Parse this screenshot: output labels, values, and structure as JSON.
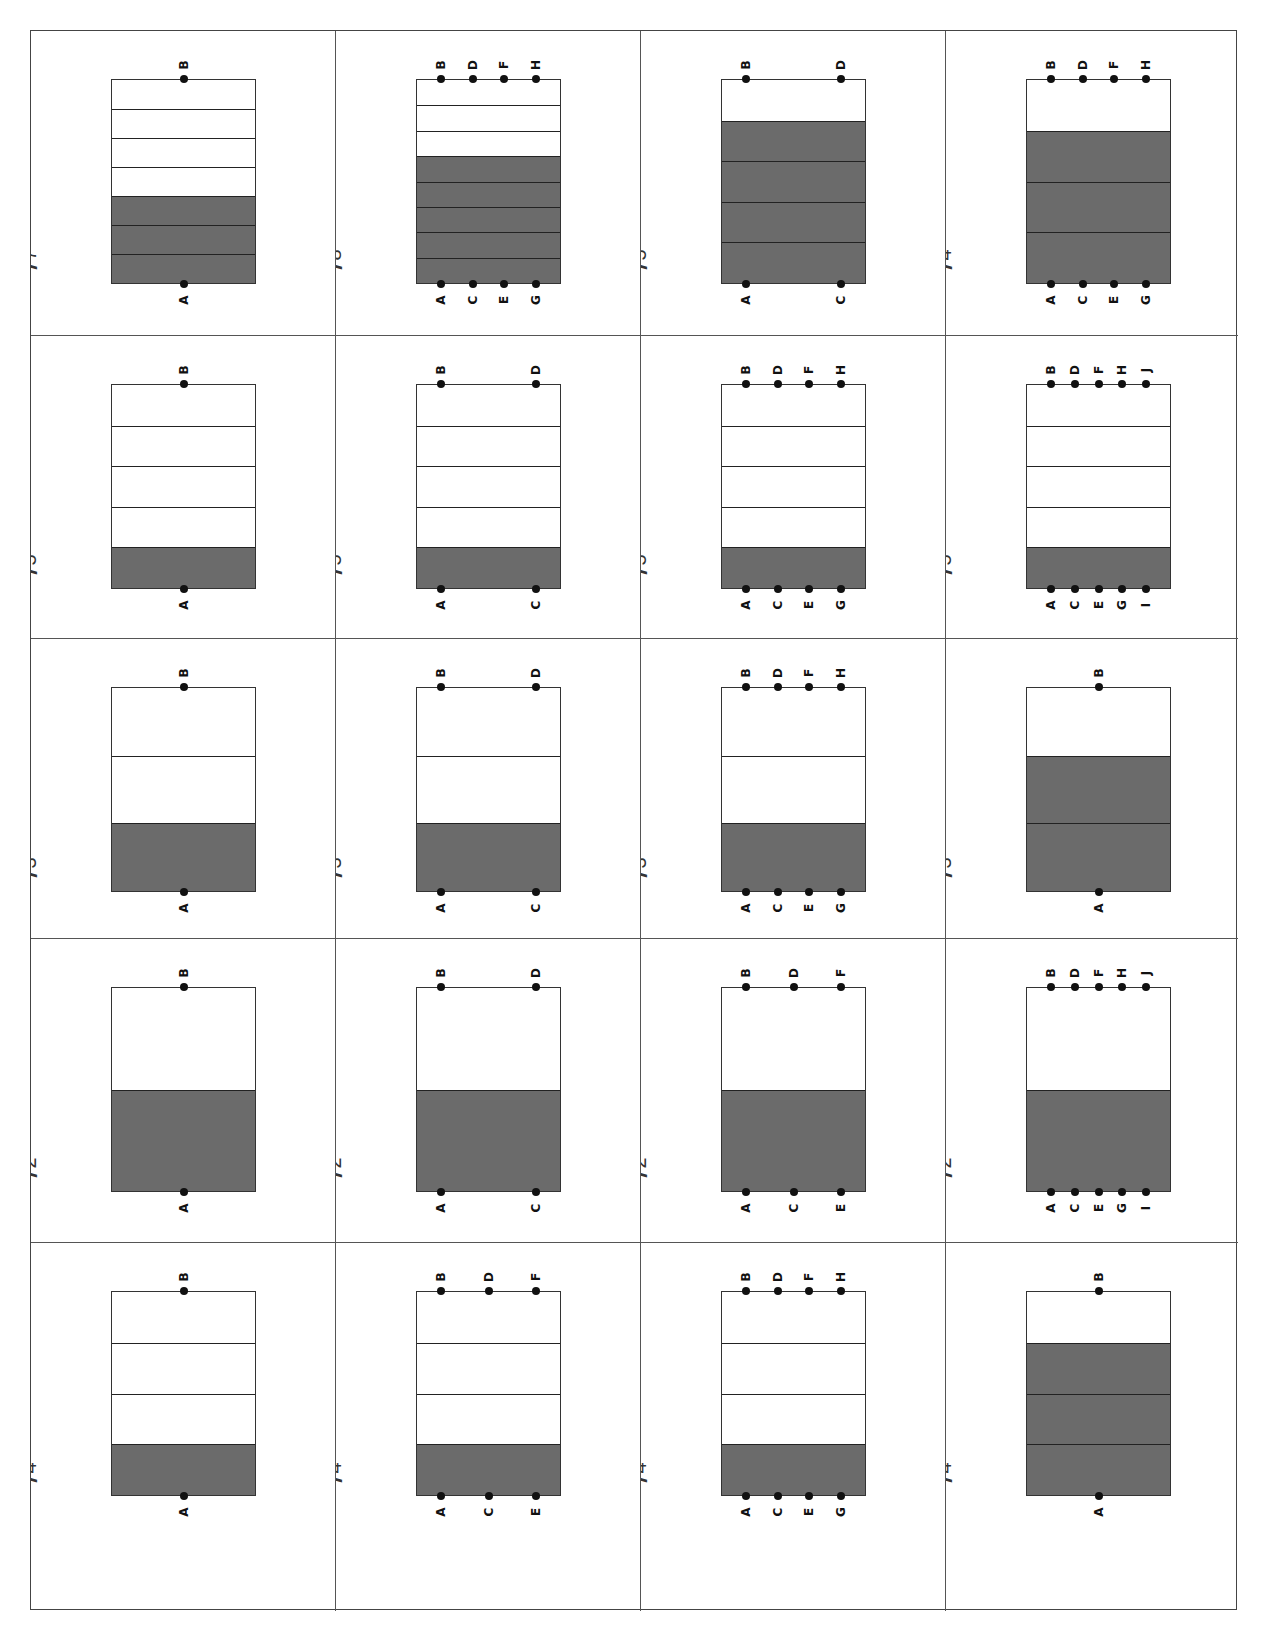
{
  "worksheet": {
    "phrase": "is also",
    "shade_color": "#6b6b6b",
    "rows": [
      [
        {
          "num": "3",
          "den": "7",
          "parts": 7,
          "shaded": 3,
          "bottom": [
            "A"
          ],
          "top": [
            "B"
          ]
        },
        {
          "num": "5",
          "den": "8",
          "parts": 8,
          "shaded": 5,
          "bottom": [
            "A",
            "C",
            "E",
            "G"
          ],
          "top": [
            "B",
            "D",
            "F",
            "H"
          ]
        },
        {
          "num": "4",
          "den": "5",
          "parts": 5,
          "shaded": 4,
          "bottom": [
            "A",
            "C"
          ],
          "top": [
            "B",
            "D"
          ]
        },
        {
          "num": "3",
          "den": "4",
          "parts": 4,
          "shaded": 3,
          "bottom": [
            "A",
            "C",
            "E",
            "G"
          ],
          "top": [
            "B",
            "D",
            "F",
            "H"
          ]
        }
      ],
      [
        {
          "num": "1",
          "den": "5",
          "parts": 5,
          "shaded": 1,
          "bottom": [
            "A"
          ],
          "top": [
            "B"
          ]
        },
        {
          "num": "1",
          "den": "5",
          "parts": 5,
          "shaded": 1,
          "bottom": [
            "A",
            "C"
          ],
          "top": [
            "B",
            "D"
          ]
        },
        {
          "num": "1",
          "den": "5",
          "parts": 5,
          "shaded": 1,
          "bottom": [
            "A",
            "C",
            "E",
            "G"
          ],
          "top": [
            "B",
            "D",
            "F",
            "H"
          ]
        },
        {
          "num": "1",
          "den": "5",
          "parts": 5,
          "shaded": 1,
          "bottom": [
            "A",
            "C",
            "E",
            "G",
            "I"
          ],
          "top": [
            "B",
            "D",
            "F",
            "H",
            "J"
          ]
        }
      ],
      [
        {
          "num": "1",
          "den": "3",
          "parts": 3,
          "shaded": 1,
          "bottom": [
            "A"
          ],
          "top": [
            "B"
          ]
        },
        {
          "num": "1",
          "den": "3",
          "parts": 3,
          "shaded": 1,
          "bottom": [
            "A",
            "C"
          ],
          "top": [
            "B",
            "D"
          ]
        },
        {
          "num": "1",
          "den": "3",
          "parts": 3,
          "shaded": 1,
          "bottom": [
            "A",
            "C",
            "E",
            "G"
          ],
          "top": [
            "B",
            "D",
            "F",
            "H"
          ]
        },
        {
          "num": "2",
          "den": "3",
          "parts": 3,
          "shaded": 2,
          "bottom": [
            "A"
          ],
          "top": [
            "B"
          ]
        }
      ],
      [
        {
          "num": "1",
          "den": "2",
          "parts": 2,
          "shaded": 1,
          "bottom": [
            "A"
          ],
          "top": [
            "B"
          ]
        },
        {
          "num": "1",
          "den": "2",
          "parts": 2,
          "shaded": 1,
          "bottom": [
            "A",
            "C"
          ],
          "top": [
            "B",
            "D"
          ]
        },
        {
          "num": "1",
          "den": "2",
          "parts": 2,
          "shaded": 1,
          "bottom": [
            "A",
            "C",
            "E"
          ],
          "top": [
            "B",
            "D",
            "F"
          ]
        },
        {
          "num": "1",
          "den": "2",
          "parts": 2,
          "shaded": 1,
          "bottom": [
            "A",
            "C",
            "E",
            "G",
            "I"
          ],
          "top": [
            "B",
            "D",
            "F",
            "H",
            "J"
          ]
        }
      ],
      [
        {
          "num": "1",
          "den": "4",
          "parts": 4,
          "shaded": 1,
          "bottom": [
            "A"
          ],
          "top": [
            "B"
          ]
        },
        {
          "num": "1",
          "den": "4",
          "parts": 4,
          "shaded": 1,
          "bottom": [
            "A",
            "C",
            "E"
          ],
          "top": [
            "B",
            "D",
            "F"
          ]
        },
        {
          "num": "1",
          "den": "4",
          "parts": 4,
          "shaded": 1,
          "bottom": [
            "A",
            "C",
            "E",
            "G"
          ],
          "top": [
            "B",
            "D",
            "F",
            "H"
          ]
        },
        {
          "num": "3",
          "den": "4",
          "parts": 4,
          "shaded": 3,
          "bottom": [
            "A"
          ],
          "top": [
            "B"
          ]
        }
      ]
    ]
  }
}
